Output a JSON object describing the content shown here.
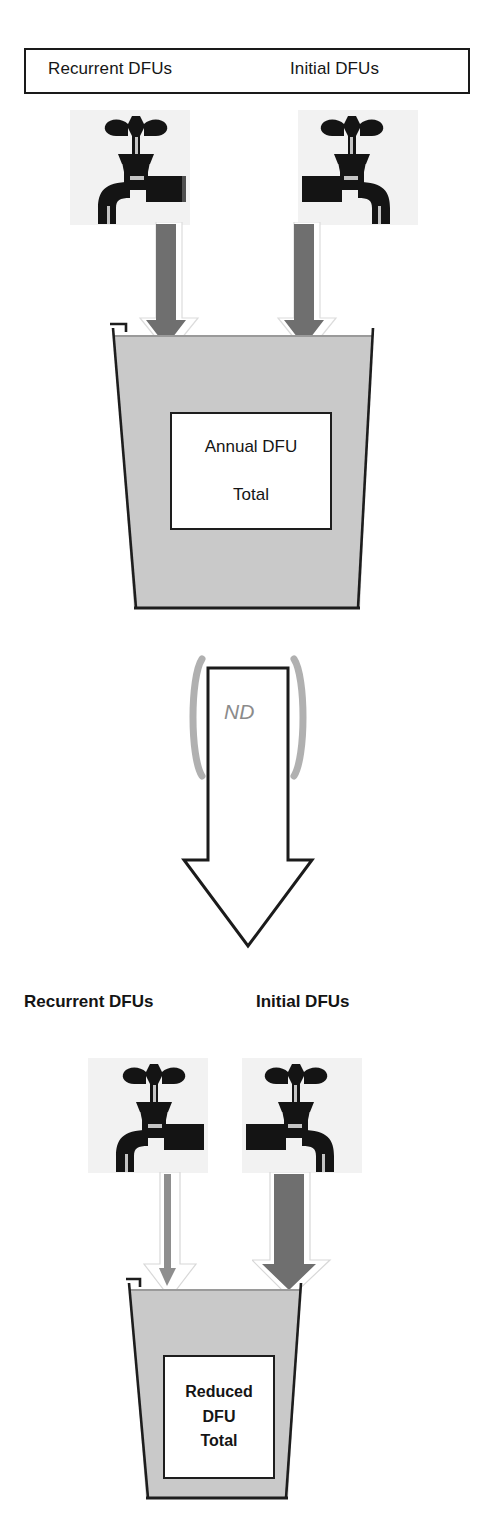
{
  "diagram": {
    "title_box": {
      "left_label": "Recurrent  DFUs",
      "right_label": "Initial DFUs"
    },
    "top_section": {
      "left_source_label": "Recurrent  DFUs",
      "right_source_label": "Initial DFUs",
      "left_faucet_icon": "faucet-icon",
      "right_faucet_icon": "faucet-icon",
      "left_flow_arrow_icon": "down-arrow-icon",
      "right_flow_arrow_icon": "down-arrow-icon",
      "bucket_icon": "bucket-icon",
      "bucket_caption_line1": "Annual DFU",
      "bucket_caption_line2": "Total"
    },
    "transition": {
      "arrow_icon": "large-down-arrow-icon",
      "bracket_left_icon": "left-bracket-icon",
      "bracket_right_icon": "right-bracket-icon",
      "label": "ND"
    },
    "bottom_section": {
      "left_source_label": "Recurrent DFUs",
      "right_source_label": "Initial DFUs",
      "left_faucet_icon": "faucet-icon",
      "right_faucet_icon": "faucet-icon",
      "left_flow_arrow_icon": "thin-down-arrow-icon",
      "right_flow_arrow_icon": "thick-down-arrow-icon",
      "bucket_icon": "bucket-icon",
      "bucket_caption_line1": "Reduced",
      "bucket_caption_line2": "DFU",
      "bucket_caption_line3": "Total"
    },
    "colors": {
      "outline": "#1a1a1a",
      "bucket_fill": "#c9c9c9",
      "flow_dark": "#6f6f6f",
      "flow_light": "#ffffff",
      "bracket_gray": "#b0b0b0",
      "nd_text": "#8b8b8b"
    }
  }
}
